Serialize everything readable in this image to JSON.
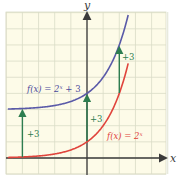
{
  "chart_data": {
    "type": "line",
    "title": "",
    "xlabel": "x",
    "ylabel": "y",
    "xlim": [
      -5,
      5
    ],
    "ylim": [
      -1,
      9
    ],
    "grid": true,
    "legend": "inline labels",
    "series": [
      {
        "name": "f(x) = 2^x + 3",
        "label_text": "f(x) = 2",
        "label_exp": "x",
        "label_tail": " + 3",
        "color": "#5a5aa8",
        "expression": "2^x + 3",
        "x": [
          -5,
          -4,
          -3,
          -2,
          -1,
          0,
          1,
          2,
          2.58
        ],
        "y": [
          3.03,
          3.06,
          3.13,
          3.25,
          3.5,
          4,
          5,
          7,
          9
        ]
      },
      {
        "name": "f(x) = 2^x",
        "label_text": "f(x) = 2",
        "label_exp": "x",
        "label_tail": "",
        "color": "#e0443c",
        "expression": "2^x",
        "x": [
          -5,
          -4,
          -3,
          -2,
          -1,
          0,
          1,
          2,
          2.58
        ],
        "y": [
          0.03,
          0.06,
          0.13,
          0.25,
          0.5,
          1,
          2,
          4,
          6
        ]
      }
    ],
    "annotations": [
      {
        "text": "+3",
        "x": -4,
        "y_from": 0.06,
        "y_to": 3.06,
        "color": "#2e7d4f"
      },
      {
        "text": "+3",
        "x": 0,
        "y_from": 1,
        "y_to": 4,
        "color": "#2e7d4f"
      },
      {
        "text": "+3",
        "x": 2,
        "y_from": 4,
        "y_to": 7,
        "color": "#2e7d4f"
      }
    ]
  },
  "colors": {
    "grid_bg": "#fdfbe8",
    "grid_line": "#d9dcc6",
    "axis": "#3a3a3a",
    "arrow": "#2e7d4f",
    "blue": "#5a5aa8",
    "red": "#e0443c"
  },
  "labels": {
    "x_axis": "x",
    "y_axis": "y",
    "blue_curve_label": "f(x) = 2",
    "blue_curve_exp": "x",
    "blue_curve_tail": " + 3",
    "red_curve_label": "f(x) = 2",
    "red_curve_exp": "x",
    "arrow_left": "+3",
    "arrow_mid": "+3",
    "arrow_right": "+3"
  }
}
